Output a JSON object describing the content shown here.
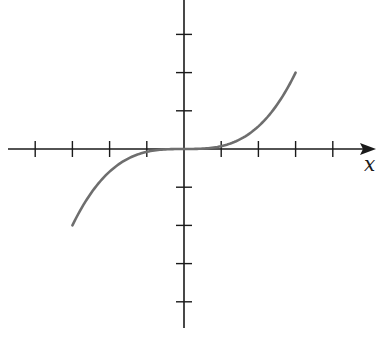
{
  "chart_data": {
    "type": "line",
    "title": "",
    "xlabel": "x",
    "ylabel": "",
    "xlim": [
      -4,
      5
    ],
    "ylim": [
      -5,
      4
    ],
    "grid": false,
    "x_ticks": [
      -4,
      -3,
      -2,
      -1,
      1,
      2,
      3,
      4
    ],
    "y_ticks": [
      -4,
      -3,
      -2,
      -1,
      1,
      2,
      3
    ],
    "series": [
      {
        "name": "curve",
        "color": "#6e6e6e",
        "x": [
          -3,
          -2.5,
          -2,
          -1.5,
          -1,
          -0.5,
          0,
          0.5,
          1,
          1.5,
          2,
          2.5,
          3
        ],
        "values": [
          -2,
          -1.16,
          -0.59,
          -0.25,
          -0.07,
          -0.01,
          0,
          0.01,
          0.07,
          0.25,
          0.59,
          1.16,
          2
        ]
      }
    ]
  },
  "layout": {
    "origin_px": [
      184,
      149
    ],
    "unit_px_x": 37.2,
    "unit_px_y": 38.2
  }
}
